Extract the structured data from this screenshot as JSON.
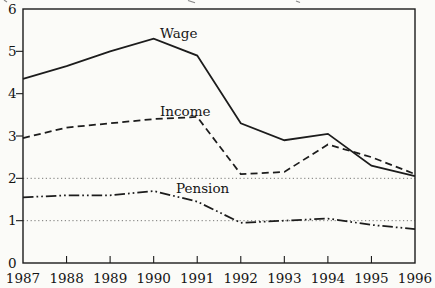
{
  "figure": {
    "background_color": "#fbfbf8",
    "ink_color": "#1c1c1c",
    "gridline_style": "fine-dotted"
  },
  "chart_data": {
    "type": "line",
    "title": "",
    "x": [
      "1987",
      "1988",
      "1989",
      "1990",
      "1991",
      "1992",
      "1993",
      "1994",
      "1995",
      "1996"
    ],
    "xlabel": "",
    "ylabel": "",
    "ylim": [
      0,
      6
    ],
    "yticks": [
      0,
      1,
      2,
      3,
      4,
      5,
      6
    ],
    "dotted_gridlines_y": [
      1,
      2
    ],
    "grid": "horizontal dotted lines at y=1 and y=2 only",
    "legend": "inline labels next to lines",
    "series": [
      {
        "name": "Wage",
        "line_style": "solid",
        "values": [
          4.35,
          4.65,
          5.0,
          5.3,
          4.9,
          3.3,
          2.9,
          3.05,
          2.3,
          2.05
        ]
      },
      {
        "name": "Income",
        "line_style": "dashed",
        "values": [
          2.95,
          3.2,
          3.3,
          3.4,
          3.45,
          2.1,
          2.15,
          2.8,
          2.5,
          2.1
        ]
      },
      {
        "name": "Pension",
        "line_style": "dash-dot-dot",
        "values": [
          1.55,
          1.6,
          1.6,
          1.7,
          1.45,
          0.95,
          1.0,
          1.05,
          0.9,
          0.8
        ]
      }
    ]
  }
}
